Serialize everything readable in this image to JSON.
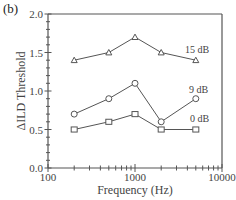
{
  "panel_label": "(b)",
  "chart_data": {
    "type": "line",
    "title": "",
    "xlabel": "Frequency (Hz)",
    "ylabel": "ΔILD Threshold",
    "xscale": "log",
    "xlim": [
      100,
      10000
    ],
    "ylim": [
      0.0,
      2.0
    ],
    "x_ticks": [
      100,
      1000,
      10000
    ],
    "x_tick_labels": [
      "100",
      "1000",
      "10000"
    ],
    "y_ticks": [
      0.0,
      0.5,
      1.0,
      1.5,
      2.0
    ],
    "y_tick_labels": [
      "0.0",
      "0.5",
      "1.0",
      "1.5",
      "2.0"
    ],
    "y_minor_step": 0.1,
    "grid": false,
    "x": [
      200,
      500,
      1000,
      2000,
      5000
    ],
    "series": [
      {
        "name": "15 dB",
        "marker": "triangle",
        "values": [
          1.4,
          1.5,
          1.7,
          1.5,
          1.4
        ]
      },
      {
        "name": "9 dB",
        "marker": "circle",
        "values": [
          0.7,
          0.9,
          1.1,
          0.6,
          0.9
        ]
      },
      {
        "name": "0 dB",
        "marker": "square",
        "values": [
          0.5,
          0.6,
          0.7,
          0.5,
          0.5
        ]
      }
    ],
    "annotations": [
      {
        "text": "15 dB",
        "near_series": "15 dB"
      },
      {
        "text": "9 dB",
        "near_series": "9 dB"
      },
      {
        "text": "0 dB",
        "near_series": "0 dB"
      }
    ],
    "colors": {
      "line": "#555555",
      "axis": "#555555",
      "text": "#444444"
    }
  }
}
